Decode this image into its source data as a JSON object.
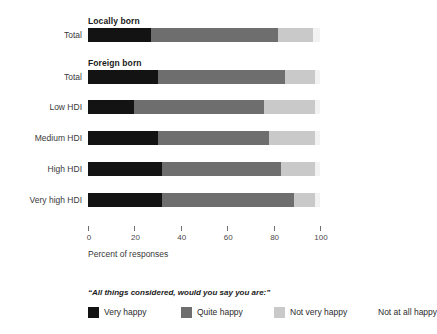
{
  "chart_data": {
    "type": "bar",
    "orientation": "horizontal",
    "stacked": true,
    "stacked_percent": true,
    "title": "",
    "xlabel": "Percent of responses",
    "ylabel": "",
    "xlim": [
      0,
      100
    ],
    "xticks": [
      0,
      20,
      40,
      60,
      80,
      100
    ],
    "xtick_labels": [
      "0",
      "20",
      "40",
      "60",
      "80",
      "100"
    ],
    "grid": false,
    "legend_position": "bottom",
    "legend_title": "“All things considered, would you say you are:”",
    "groups": [
      {
        "label": "Locally born",
        "row_indices": [
          0
        ]
      },
      {
        "label": "Foreign born",
        "row_indices": [
          1,
          2,
          3,
          4,
          5
        ]
      }
    ],
    "categories": [
      "Total",
      "Total",
      "Low HDI",
      "Medium HDI",
      "High HDI",
      "Very high HDI"
    ],
    "series": [
      {
        "name": "Very happy",
        "color": "#131313",
        "values": [
          27,
          30,
          20,
          30,
          32,
          32
        ]
      },
      {
        "name": "Quite happy",
        "color": "#6e6e6e",
        "values": [
          55,
          55,
          56,
          48,
          51,
          57
        ]
      },
      {
        "name": "Not very happy",
        "color": "#c9c9c9",
        "values": [
          15,
          13,
          22,
          20,
          15,
          9
        ]
      },
      {
        "name": "Not at all happy",
        "color": "#f2f2f2",
        "values": [
          3,
          2,
          2,
          2,
          2,
          2
        ]
      }
    ],
    "legend_entries": [
      {
        "label": "Very happy",
        "color": "#131313"
      },
      {
        "label": "Quite happy",
        "color": "#6e6e6e"
      },
      {
        "label": "Not very happy",
        "color": "#c9c9c9"
      },
      {
        "label": "Not at all happy",
        "color": "#fcfcfc"
      }
    ]
  },
  "layout": {
    "plot_left_px": 88,
    "plot_width_px": 232,
    "row_tops_px": [
      28,
      70,
      100,
      131,
      162,
      193
    ],
    "group_head_tops_px": [
      16,
      58
    ],
    "legend_item_lefts_px": [
      0,
      93,
      186,
      290
    ],
    "legend_swatch_visible": [
      true,
      true,
      true,
      false
    ]
  }
}
